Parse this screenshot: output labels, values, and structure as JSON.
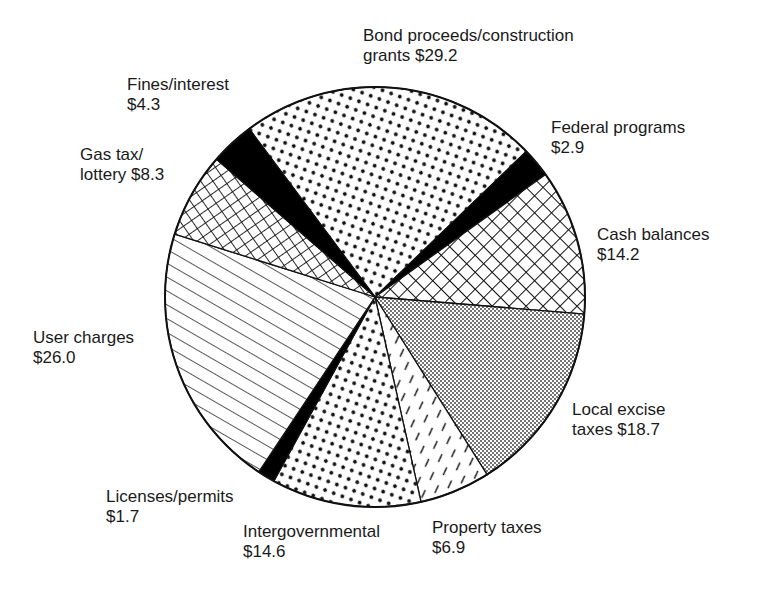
{
  "chart_data": {
    "type": "pie",
    "title": "",
    "units": "$",
    "center": [
      375,
      297
    ],
    "radius": 210,
    "start_angle_deg": -126.8,
    "slices": [
      {
        "name": "Bond proceeds/construction grants",
        "value": 29.2,
        "pattern": "dots-large",
        "label_lines": [
          "Bond proceeds/construction",
          "grants $29.2"
        ],
        "label_pos": [
          363,
          26
        ]
      },
      {
        "name": "Federal programs",
        "value": 2.9,
        "pattern": "solid-black",
        "label_lines": [
          "Federal programs",
          "$2.9"
        ],
        "label_pos": [
          551,
          118
        ]
      },
      {
        "name": "Cash balances",
        "value": 14.2,
        "pattern": "crosshatch-diagonal",
        "label_lines": [
          "Cash balances",
          "$14.2"
        ],
        "label_pos": [
          597,
          225
        ]
      },
      {
        "name": "Local excise taxes",
        "value": 18.7,
        "pattern": "dots-fine",
        "label_lines": [
          "Local excise",
          "taxes $18.7"
        ],
        "label_pos": [
          572,
          400
        ]
      },
      {
        "name": "Property taxes",
        "value": 6.9,
        "pattern": "dashes-diagonal",
        "label_lines": [
          "Property taxes",
          "$6.9"
        ],
        "label_pos": [
          432,
          518
        ]
      },
      {
        "name": "Intergovernmental",
        "value": 14.6,
        "pattern": "dots-large",
        "label_lines": [
          "Intergovernmental",
          "$14.6"
        ],
        "label_pos": [
          243,
          522
        ]
      },
      {
        "name": "Licenses/permits",
        "value": 1.7,
        "pattern": "solid-black",
        "label_lines": [
          "Licenses/permits",
          "$1.7"
        ],
        "label_pos": [
          106,
          487
        ]
      },
      {
        "name": "User charges",
        "value": 26.0,
        "pattern": "lines-diagonal",
        "label_lines": [
          "User charges",
          "$26.0"
        ],
        "label_pos": [
          33,
          328
        ]
      },
      {
        "name": "Gas tax/lottery",
        "value": 8.3,
        "pattern": "grid-square",
        "label_lines": [
          "Gas tax/",
          "lottery $8.3"
        ],
        "label_pos": [
          80,
          145
        ]
      },
      {
        "name": "Fines/interest",
        "value": 4.3,
        "pattern": "solid-black",
        "label_lines": [
          "Fines/interest",
          "$4.3"
        ],
        "label_pos": [
          127,
          75
        ]
      }
    ]
  }
}
